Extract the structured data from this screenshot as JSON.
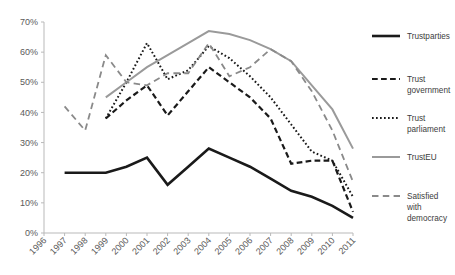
{
  "chart_data": {
    "type": "line",
    "title": "",
    "subtitle": "",
    "xlabel": "",
    "ylabel": "",
    "ylim": [
      0,
      70
    ],
    "ytick_labels": [
      "0%",
      "10%",
      "20%",
      "30%",
      "40%",
      "50%",
      "60%",
      "70%"
    ],
    "ytick_values": [
      0,
      10,
      20,
      30,
      40,
      50,
      60,
      70
    ],
    "grid": false,
    "legend_position": "right",
    "x": [
      1996,
      1997,
      1998,
      1999,
      2000,
      2001,
      2002,
      2003,
      2004,
      2005,
      2006,
      2007,
      2008,
      2009,
      2010,
      2011
    ],
    "xtick_labels": [
      "1996",
      "1997",
      "1998",
      "1999",
      "2000",
      "2001",
      "2002",
      "2003",
      "2004",
      "2005",
      "2006",
      "2007",
      "2008",
      "2009",
      "2010",
      "2011"
    ],
    "series": [
      {
        "name": "Trustparties",
        "style": "solid",
        "color": "#1a1a1a",
        "width": 2.6,
        "values": [
          null,
          20,
          20,
          20,
          22,
          25,
          16,
          22,
          28,
          25,
          22,
          18,
          14,
          12,
          9,
          5
        ]
      },
      {
        "name": "Trust government",
        "style": "dashed",
        "color": "#1a1a1a",
        "width": 2.2,
        "values": [
          null,
          null,
          null,
          38,
          44,
          49,
          39,
          47,
          55,
          50,
          45,
          38,
          23,
          24,
          24,
          7
        ]
      },
      {
        "name": "Trust parliament",
        "style": "dotted",
        "color": "#1a1a1a",
        "width": 2.0,
        "values": [
          null,
          null,
          null,
          38,
          50,
          63,
          51,
          54,
          62,
          58,
          52,
          45,
          36,
          27,
          24,
          12
        ]
      },
      {
        "name": "TrustEU",
        "style": "solid",
        "color": "#9a9a9a",
        "width": 2.0,
        "values": [
          null,
          null,
          null,
          45,
          50,
          55,
          59,
          63,
          67,
          66,
          64,
          61,
          57,
          49,
          41,
          28
        ]
      },
      {
        "name": "Satisfied with democracy",
        "style": "longdash",
        "color": "#8a8a8a",
        "width": 1.8,
        "values": [
          null,
          42,
          34,
          59,
          50,
          49,
          53,
          53,
          63,
          52,
          55,
          61,
          57,
          47,
          34,
          17
        ]
      }
    ]
  },
  "legend": {
    "items": [
      {
        "label": "Trustparties"
      },
      {
        "label": "Trust government"
      },
      {
        "label": "Trust parliament"
      },
      {
        "label": "TrustEU"
      },
      {
        "label": "Satisfied with democracy"
      }
    ]
  }
}
